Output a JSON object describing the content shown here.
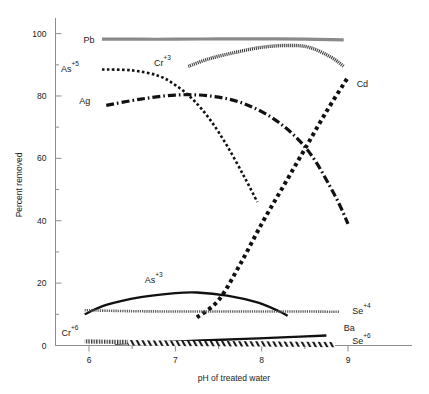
{
  "chart_data": {
    "type": "line",
    "title": "",
    "xlabel": "pH of treated water",
    "ylabel": "Percent removed",
    "xlim": [
      5.6,
      9.45
    ],
    "ylim": [
      0,
      105
    ],
    "xticks": [
      "6",
      "7",
      "8",
      "9"
    ],
    "xtick_values": [
      6,
      7,
      8,
      9
    ],
    "yticks": [
      "0",
      "20",
      "40",
      "60",
      "80",
      "100"
    ],
    "ytick_values": [
      0,
      20,
      40,
      60,
      80,
      100
    ],
    "y_minor_ticks": [
      10,
      30,
      50,
      70,
      90
    ],
    "grid": false,
    "legend_position": "inline-labels",
    "series": [
      {
        "name": "Pb",
        "label": "Pb",
        "style": "thick-grey-band",
        "color": "#8a8a8a",
        "x": [
          6.15,
          6.6,
          7.0,
          7.5,
          8.0,
          8.5,
          8.95
        ],
        "values": [
          98.2,
          98.2,
          98.2,
          98.3,
          98.3,
          98.2,
          98.0
        ]
      },
      {
        "name": "Cr+3",
        "label": "Cr",
        "label_sup": "+3",
        "style": "textured-band",
        "color": "#3a3a3a",
        "x": [
          7.15,
          7.4,
          7.7,
          8.0,
          8.3,
          8.55,
          8.8,
          8.95
        ],
        "values": [
          89.5,
          92.0,
          94.0,
          95.6,
          96.2,
          95.6,
          92.5,
          89.5
        ]
      },
      {
        "name": "As+5",
        "label": "As",
        "label_sup": "+5",
        "style": "fine-dotted",
        "color": "#111111",
        "x": [
          6.15,
          6.5,
          6.8,
          7.0,
          7.2,
          7.4,
          7.6,
          7.8,
          7.95
        ],
        "values": [
          88.5,
          88.2,
          86.5,
          83.5,
          79.0,
          72.5,
          64.0,
          54.0,
          46.0
        ]
      },
      {
        "name": "Ag",
        "label": "Ag",
        "style": "dash-dot",
        "color": "#111111",
        "x": [
          6.2,
          6.6,
          7.0,
          7.4,
          7.8,
          8.2,
          8.55,
          8.85,
          9.0
        ],
        "values": [
          77.0,
          79.0,
          80.3,
          80.0,
          77.5,
          71.5,
          62.0,
          48.0,
          39.0
        ]
      },
      {
        "name": "Cd",
        "label": "Cd",
        "style": "thick-dotted",
        "color": "#111111",
        "x": [
          7.25,
          7.5,
          7.75,
          8.0,
          8.25,
          8.5,
          8.75,
          9.0
        ],
        "values": [
          9.0,
          14.5,
          26.0,
          39.0,
          51.0,
          63.0,
          75.0,
          86.0
        ]
      },
      {
        "name": "As+3",
        "label": "As",
        "label_sup": "+3",
        "style": "solid-thick",
        "color": "#111111",
        "x": [
          5.95,
          6.2,
          6.6,
          7.0,
          7.25,
          7.6,
          7.95,
          8.2,
          8.3
        ],
        "values": [
          10.0,
          13.0,
          15.5,
          16.8,
          17.0,
          16.0,
          13.8,
          11.0,
          9.5
        ]
      },
      {
        "name": "Se+4",
        "label": "Se",
        "label_sup": "+4",
        "style": "thin-hatched",
        "color": "#5a5a5a",
        "x": [
          5.95,
          6.5,
          7.0,
          7.5,
          8.0,
          8.5,
          8.9
        ],
        "values": [
          11.3,
          11.0,
          10.9,
          10.9,
          10.9,
          10.9,
          10.8
        ]
      },
      {
        "name": "Ba",
        "label": "Ba",
        "style": "solid-thick",
        "color": "#111111",
        "x": [
          6.3,
          6.8,
          7.3,
          7.8,
          8.3,
          8.75
        ],
        "values": [
          0.6,
          1.1,
          1.6,
          2.1,
          2.7,
          3.2
        ]
      },
      {
        "name": "Cr+6",
        "label": "Cr",
        "label_sup": "+6",
        "style": "fine-hatched-short",
        "color": "#4a4a4a",
        "x": [
          5.95,
          6.2,
          6.45
        ],
        "values": [
          1.3,
          1.2,
          1.2
        ]
      },
      {
        "name": "Se+6",
        "label": "Se",
        "label_sup": "+6",
        "style": "hatched-band",
        "color": "#2a2a2a",
        "x": [
          6.45,
          7.0,
          7.5,
          8.0,
          8.5,
          8.85
        ],
        "values": [
          0.9,
          0.7,
          0.6,
          0.5,
          0.4,
          0.3
        ]
      }
    ],
    "annotations": [
      {
        "text": "Pb",
        "x": 6.0,
        "y": 98.0
      },
      {
        "text": "Cr+3",
        "x": 6.85,
        "y": 90.5
      },
      {
        "text": "As+5",
        "x": 5.78,
        "y": 88.5
      },
      {
        "text": "Ag",
        "x": 5.95,
        "y": 78.5
      },
      {
        "text": "Cd",
        "x": 9.1,
        "y": 84.0
      },
      {
        "text": "As+3",
        "x": 6.75,
        "y": 21.0
      },
      {
        "text": "Se+4",
        "x": 9.05,
        "y": 11.0
      },
      {
        "text": "Ba",
        "x": 8.95,
        "y": 5.5
      },
      {
        "text": "Se+6",
        "x": 9.05,
        "y": 1.5
      },
      {
        "text": "Cr+6",
        "x": 5.78,
        "y": 4.0
      }
    ]
  }
}
